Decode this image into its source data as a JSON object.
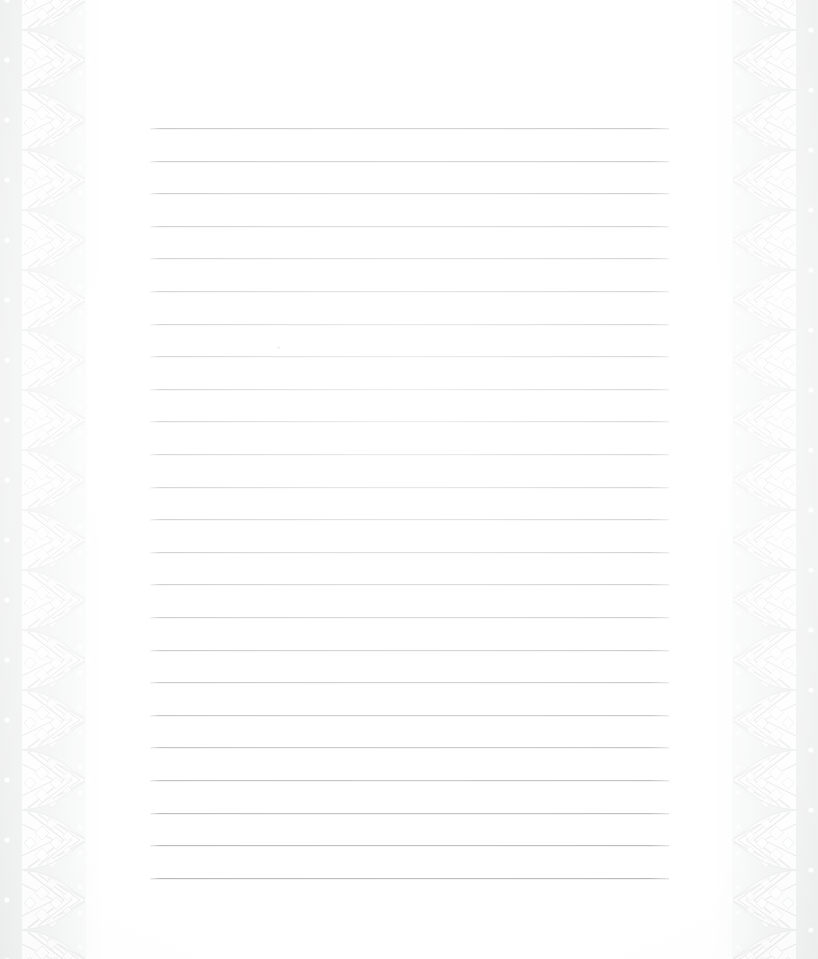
{
  "page": {
    "width": 818,
    "height": 959,
    "background_color": "#f1f2f2",
    "sheet_color": "#ffffff"
  },
  "sheet": {
    "name": "writing-paper",
    "left": 100,
    "width": 618,
    "description": "Blank white lined notepaper sheet"
  },
  "ruled_lines": {
    "count": 24,
    "color": "#969a9d",
    "thickness_px": 1,
    "left_x": 150,
    "right_x": 669,
    "width_px": 519,
    "first_y": 128,
    "spacing_px": 32.6,
    "y_positions": [
      128,
      160.6,
      193.2,
      225.8,
      258.4,
      291,
      323.6,
      356.2,
      388.8,
      421.4,
      454,
      486.6,
      519.2,
      551.8,
      584.4,
      617,
      649.6,
      682.2,
      714.8,
      747.4,
      780,
      812.6,
      845.2,
      877.8
    ]
  },
  "borders": {
    "left": {
      "name": "lace-border-left",
      "width_px": 104,
      "style": "scalloped-lace",
      "motif": "diamond-fan-scallop",
      "repeat_px": 60,
      "color": "#ffffff",
      "shadow_color": "#e3e4e5",
      "dot_column": true,
      "dot_count": 16
    },
    "right": {
      "name": "lace-border-right",
      "width_px": 104,
      "style": "scalloped-lace",
      "motif": "diamond-fan-scallop",
      "repeat_px": 60,
      "color": "#ffffff",
      "shadow_color": "#e3e4e5",
      "dot_column": true,
      "dot_count": 16,
      "mirrored": true
    }
  },
  "artifacts": [
    {
      "name": "scan-speck",
      "x": 277,
      "y": 346
    }
  ]
}
